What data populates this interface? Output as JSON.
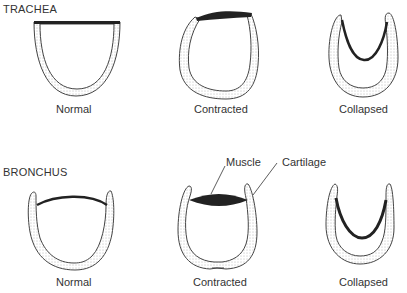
{
  "sections": {
    "trachea": {
      "title": "TRACHEA",
      "states": [
        "Normal",
        "Contracted",
        "Collapsed"
      ]
    },
    "bronchus": {
      "title": "BRONCHUS",
      "states": [
        "Normal",
        "Contracted",
        "Collapsed"
      ]
    }
  },
  "annotations": {
    "muscle": "Muscle",
    "cartilage": "Cartilage"
  },
  "colors": {
    "muscle": "#222222",
    "outline": "#444444",
    "text": "#333333"
  }
}
